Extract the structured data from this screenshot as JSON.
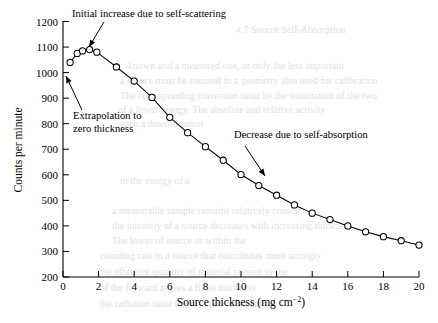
{
  "figure": {
    "title": "",
    "background": "#ffffff",
    "ink_color": "#000000"
  },
  "axes": {
    "y_title": "Counts per minute",
    "x_title_main": "Source thickness (mg cm",
    "x_title_sup": "−2",
    "x_title_close": ")",
    "x_title_full": "Source thickness (mg cm−2)",
    "y_ticks": [
      "200",
      "300",
      "400",
      "500",
      "600",
      "700",
      "800",
      "900",
      "1000",
      "1100",
      "1200"
    ],
    "x_ticks": [
      "0",
      "2",
      "4",
      "6",
      "8",
      "10",
      "12",
      "14",
      "16",
      "18",
      "20"
    ]
  },
  "annotations": [
    {
      "id": "self-scattering",
      "text": "Initial increase due to self-scattering",
      "text_x": 72,
      "text_y": 17,
      "arrow_from_x": 104,
      "arrow_from_y": 22,
      "arrow_to_x": 89,
      "arrow_to_y": 47
    },
    {
      "id": "extrapolation",
      "line1": "Extrapolation to",
      "line2": "zero thickness",
      "text_x": 73,
      "text_y": 119,
      "arrow_from_x": 82,
      "arrow_from_y": 110,
      "arrow_to_x": 66,
      "arrow_to_y": 76
    },
    {
      "id": "self-absorption",
      "text": "Decrease due to self-absorption",
      "text_x": 234,
      "text_y": 138,
      "arrow_from_x": 245,
      "arrow_from_y": 146,
      "arrow_to_x": 265,
      "arrow_to_y": 176
    }
  ],
  "chart_data": {
    "type": "line",
    "title": "",
    "xlabel": "Source thickness (mg cm−2)",
    "ylabel": "Counts per minute",
    "xlim": [
      0,
      20
    ],
    "ylim": [
      200,
      1200
    ],
    "xticks": [
      0,
      2,
      4,
      6,
      8,
      10,
      12,
      14,
      16,
      18,
      20
    ],
    "yticks": [
      200,
      300,
      400,
      500,
      600,
      700,
      800,
      900,
      1000,
      1100,
      1200
    ],
    "grid": false,
    "legend": false,
    "marker": "open-circle",
    "series": [
      {
        "name": "counts vs source thickness",
        "x": [
          0.4,
          0.8,
          1.1,
          1.5,
          1.9,
          3.0,
          4.0,
          5.0,
          6.0,
          7.0,
          8.0,
          9.0,
          10.0,
          11.0,
          12.0,
          13.0,
          14.0,
          15.0,
          16.0,
          17.0,
          18.0,
          19.0,
          20.0
        ],
        "y": [
          1040,
          1075,
          1085,
          1090,
          1080,
          1022,
          967,
          903,
          825,
          765,
          710,
          657,
          601,
          558,
          520,
          482,
          450,
          425,
          400,
          377,
          358,
          342,
          325
        ]
      }
    ],
    "annotations": [
      "Initial increase due to self-scattering",
      "Extrapolation to zero thickness",
      "Decrease due to self-absorption"
    ]
  },
  "background_text": {
    "lines": [
      {
        "text": "4.7  Source Self-Absorption",
        "x": 236,
        "y": 24
      },
      {
        "text": "known and a measured one, or only the less important",
        "x": 128,
        "y": 60
      },
      {
        "text": "a source must be counted in a geometry also used for calibration",
        "x": 120,
        "y": 75
      },
      {
        "text": "The corresponding correction must be the summation of the two",
        "x": 120,
        "y": 90
      },
      {
        "text": "of a lower energy. The absolute and relative activity",
        "x": 118,
        "y": 104
      },
      {
        "text": "such a determination",
        "x": 120,
        "y": 118
      },
      {
        "text": "in the energy of a",
        "x": 120,
        "y": 175
      },
      {
        "text": "a measurable sample remains relatively constant",
        "x": 112,
        "y": 205
      },
      {
        "text": "the intensity of a source decreases with increasing thickness",
        "x": 112,
        "y": 220
      },
      {
        "text": "The lower of source or within the",
        "x": 112,
        "y": 235
      },
      {
        "text": "counting rate in a source that contributes more strongly",
        "x": 100,
        "y": 250
      },
      {
        "text": "the effective quantity of material present in the",
        "x": 100,
        "y": 266
      },
      {
        "text": "of the forward angles a finite thickness",
        "x": 100,
        "y": 282
      },
      {
        "text": "the radiation must traverse before escaping",
        "x": 100,
        "y": 298
      }
    ]
  }
}
